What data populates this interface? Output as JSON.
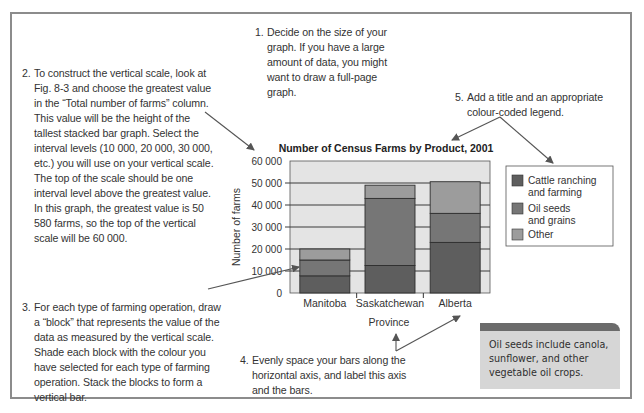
{
  "notes": {
    "step1": {
      "number": "1.",
      "text": "Decide on the size of your graph. If you have a large amount of data, you might want to draw a full-page graph."
    },
    "step2": {
      "number": "2.",
      "text": "To construct the vertical scale, look at Fig. 8-3 and choose the greatest value in the “Total number of farms” column. This value will be the height of the tallest stacked bar graph. Select the interval levels (10 000, 20 000, 30 000, etc.) you will use on your vertical scale. The top of the scale should be one interval level above the greatest value. In this graph, the greatest value is 50 580 farms, so the top of the vertical scale will be 60 000."
    },
    "step3": {
      "number": "3.",
      "text": "For each type of farming operation, draw a “block” that represents the value of the data as measured by the vertical scale. Shade each block with the colour you have selected for each type of farming operation. Stack the blocks to form a vertical bar."
    },
    "step4": {
      "number": "4.",
      "text": "Evenly space your bars along the horizontal axis, and label this axis and the bars."
    },
    "step5": {
      "number": "5.",
      "text": "Add a title and an appropriate colour-coded legend."
    }
  },
  "infobox": {
    "text": "Oil seeds include canola, sunflower, and other vegetable oil crops."
  },
  "colors": {
    "cattle": "#5e5e5e",
    "oilseeds": "#767676",
    "other": "#9c9c9c",
    "plot_bg": "#e4e4e4",
    "grid": "#3a3a3a",
    "arrow": "#555555"
  },
  "chart_data": {
    "type": "bar",
    "stacked": true,
    "title": "Number of Census Farms by Product, 2001",
    "xlabel": "Province",
    "ylabel": "Number of farms",
    "categories": [
      "Manitoba",
      "Saskatchewan",
      "Alberta"
    ],
    "series": [
      {
        "name": "Cattle ranching and farming",
        "key": "cattle",
        "values": [
          7800,
          12500,
          23000
        ]
      },
      {
        "name": "Oil seeds and grains",
        "key": "oilseeds",
        "values": [
          7200,
          30500,
          13200
        ]
      },
      {
        "name": "Other",
        "key": "other",
        "values": [
          5000,
          6000,
          14380
        ]
      }
    ],
    "ylim": [
      0,
      60000
    ],
    "yticks": [
      0,
      10000,
      20000,
      30000,
      40000,
      50000,
      60000
    ],
    "ytick_labels": [
      "0",
      "10 000",
      "20 000",
      "30 000",
      "40 000",
      "50 000",
      "60 000"
    ],
    "grid": true,
    "legend": {
      "position": "right",
      "entries": [
        "Cattle ranching\nand farming",
        "Oil seeds\nand grains",
        "Other"
      ]
    }
  }
}
